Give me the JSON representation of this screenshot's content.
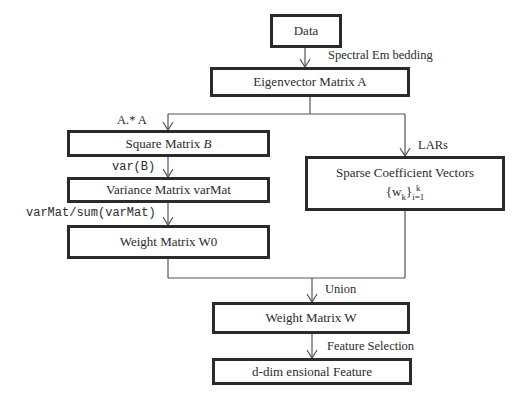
{
  "diagram": {
    "nodes": {
      "data": "Data",
      "eigen": "Eigenvector Matrix A",
      "square_prefix": "Square Matrix ",
      "square_var": "B",
      "variance": "Variance Matrix varMat",
      "w0": "Weight Matrix W0",
      "sparse_line1": "Sparse Coefficient Vectors",
      "sparse_line2_base": "{w",
      "sparse_line2_sub": "k",
      "sparse_line2_close": "}",
      "sparse_line2_sup": "k",
      "sparse_line2_lower": "i=1",
      "weight_w": "Weight Matrix W",
      "ddim": "d-dim ensional Feature"
    },
    "edges": {
      "spectral": "Spectral Em bedding",
      "elementwise": "A.* A",
      "var": "var(B)",
      "normalize": "varMat/sum(varMat)",
      "lars": "LARs",
      "union": "Union",
      "feature_selection": "Feature Selection"
    }
  }
}
